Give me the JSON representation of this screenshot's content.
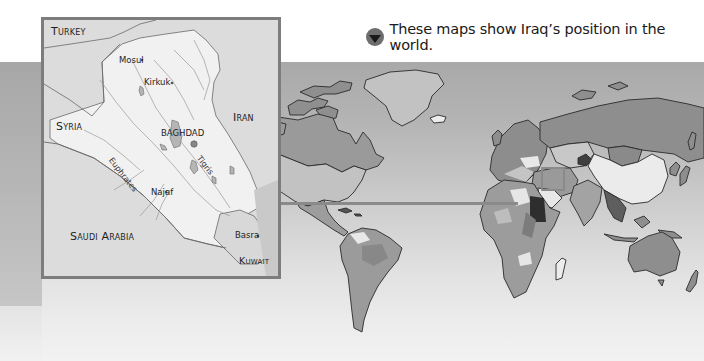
{
  "caption": {
    "icon": "down-triangle-bullet-icon",
    "text": "These maps show Iraq’s position in the world."
  },
  "inset_map": {
    "title": "Iraq",
    "countries": {
      "turkey": "Turkey",
      "syria": "Syria",
      "iran": "Iran",
      "saudi_arabia": "Saudi Arabia",
      "kuwait": "Kuwait"
    },
    "cities": {
      "mosul": "Mosul",
      "kirkuk": "Kirkuk",
      "baghdad": "BAGHDAD",
      "najaf": "Najaf",
      "basra": "Basra"
    },
    "rivers": {
      "euphrates": "Euphrates",
      "tigris": "Tigris"
    }
  },
  "world_map": {
    "highlight": "Iraq",
    "palette": {
      "ocean": "#b5b5b5",
      "land_dark": "#8a8a8a",
      "land_mid": "#9d9d9d",
      "land_light": "#c6c6c6",
      "land_white": "#ececec",
      "land_black": "#3a3a3a",
      "outline": "#2a2a2a",
      "connector": "#8a8a8a"
    }
  }
}
